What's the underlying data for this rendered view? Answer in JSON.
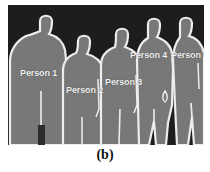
{
  "figure": {
    "caption": "(b)",
    "image": {
      "alt_description": "segmented silhouettes of five standing people",
      "background_color": "#1b1b1b",
      "silhouette_color": "#787878",
      "outline_color": "#f0f0f0"
    },
    "labels": [
      {
        "id": "person-1",
        "text": "Person 1"
      },
      {
        "id": "person-2",
        "text": "Person 2"
      },
      {
        "id": "person-3",
        "text": "Person 3"
      },
      {
        "id": "person-4",
        "text": "Person 4"
      },
      {
        "id": "person-5",
        "text": "Person 5"
      }
    ]
  }
}
